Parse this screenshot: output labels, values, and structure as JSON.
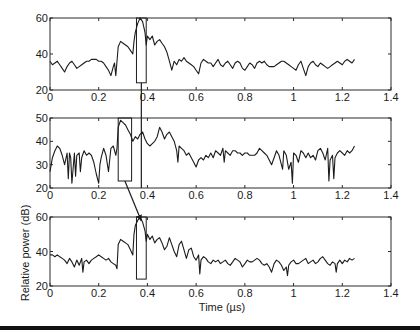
{
  "chart_data": {
    "type": "line",
    "figure": "Three stacked panels of relative power vs time with zoom boxes and arrows linking peak region",
    "xlabel": "Time (µs)",
    "ylabel": "Relative power (dB)",
    "xlim": [
      0,
      1.4
    ],
    "x_ticks": [
      0,
      0.2,
      0.4,
      0.6,
      0.8,
      1,
      1.2,
      1.4
    ],
    "x_tick_labels": [
      "0",
      "0.2",
      "0.4",
      "0.6",
      "0.8",
      "1",
      "1.2",
      "1.4"
    ],
    "grid": false,
    "legend": null,
    "panels": [
      {
        "name": "top",
        "ylim": [
          20,
          60
        ],
        "y_ticks": [
          20,
          40,
          60
        ],
        "y_tick_labels": [
          "20",
          "40",
          "60"
        ],
        "box": {
          "x0": 0.355,
          "x1": 0.395,
          "y0": 24,
          "y1": 60
        },
        "series": {
          "name": "panel-1",
          "x": [
            0,
            0.01,
            0.02,
            0.03,
            0.04,
            0.05,
            0.06,
            0.07,
            0.08,
            0.09,
            0.1,
            0.11,
            0.12,
            0.13,
            0.14,
            0.15,
            0.16,
            0.17,
            0.18,
            0.19,
            0.2,
            0.21,
            0.22,
            0.23,
            0.24,
            0.25,
            0.26,
            0.265,
            0.27,
            0.275,
            0.28,
            0.29,
            0.3,
            0.31,
            0.32,
            0.33,
            0.34,
            0.345,
            0.35,
            0.36,
            0.37,
            0.38,
            0.39,
            0.395,
            0.4,
            0.41,
            0.42,
            0.43,
            0.44,
            0.45,
            0.46,
            0.47,
            0.48,
            0.49,
            0.5,
            0.51,
            0.52,
            0.53,
            0.54,
            0.55,
            0.56,
            0.57,
            0.58,
            0.59,
            0.6,
            0.61,
            0.62,
            0.63,
            0.64,
            0.65,
            0.66,
            0.67,
            0.68,
            0.69,
            0.7,
            0.71,
            0.72,
            0.73,
            0.74,
            0.75,
            0.76,
            0.77,
            0.78,
            0.79,
            0.8,
            0.81,
            0.82,
            0.83,
            0.84,
            0.85,
            0.86,
            0.87,
            0.88,
            0.89,
            0.9,
            0.91,
            0.92,
            0.93,
            0.94,
            0.95,
            0.96,
            0.97,
            0.98,
            0.99,
            1.0,
            1.01,
            1.02,
            1.03,
            1.04,
            1.05,
            1.06,
            1.07,
            1.08,
            1.09,
            1.1,
            1.11,
            1.12,
            1.13,
            1.14,
            1.15,
            1.16,
            1.17,
            1.18,
            1.19,
            1.2,
            1.21,
            1.22,
            1.23,
            1.24,
            1.25
          ],
          "y": [
            36,
            34,
            35,
            36,
            34,
            32,
            30,
            33,
            35,
            36,
            34,
            32,
            33,
            34,
            35,
            36,
            36,
            37,
            37,
            37,
            36,
            36,
            35,
            33,
            31,
            28,
            33,
            35,
            28,
            36,
            44,
            47,
            46,
            45,
            44,
            42,
            40,
            47,
            52,
            57,
            60,
            58,
            52,
            45,
            50,
            48,
            50,
            45,
            47,
            48,
            46,
            44,
            41,
            36,
            31,
            36,
            34,
            37,
            36,
            38,
            36,
            35,
            34,
            33,
            31,
            29,
            35,
            37,
            36,
            35,
            35,
            33,
            35,
            37,
            34,
            33,
            35,
            36,
            34,
            32,
            35,
            36,
            35,
            32,
            31,
            33,
            35,
            34,
            32,
            35,
            36,
            35,
            36,
            34,
            33,
            33,
            33,
            34,
            35,
            36,
            36,
            35,
            34,
            33,
            32,
            31,
            34,
            36,
            32,
            28,
            33,
            35,
            36,
            34,
            33,
            35,
            34,
            33,
            32,
            33,
            34,
            35,
            36,
            35,
            34,
            36,
            37,
            36,
            35,
            37
          ]
        }
      },
      {
        "name": "middle",
        "ylim": [
          20,
          50
        ],
        "y_ticks": [
          20,
          30,
          40,
          50
        ],
        "y_tick_labels": [
          "20",
          "30",
          "40",
          "50"
        ],
        "box": {
          "x0": 0.28,
          "x1": 0.335,
          "y0": 23,
          "y1": 50
        },
        "series": {
          "name": "panel-2",
          "x": [
            0,
            0.01,
            0.02,
            0.03,
            0.04,
            0.05,
            0.06,
            0.07,
            0.075,
            0.08,
            0.085,
            0.09,
            0.1,
            0.105,
            0.11,
            0.12,
            0.125,
            0.13,
            0.14,
            0.15,
            0.16,
            0.17,
            0.18,
            0.19,
            0.2,
            0.205,
            0.21,
            0.22,
            0.23,
            0.24,
            0.25,
            0.26,
            0.27,
            0.275,
            0.28,
            0.29,
            0.3,
            0.31,
            0.32,
            0.33,
            0.34,
            0.35,
            0.36,
            0.37,
            0.38,
            0.39,
            0.4,
            0.41,
            0.42,
            0.43,
            0.44,
            0.45,
            0.46,
            0.47,
            0.48,
            0.49,
            0.5,
            0.51,
            0.52,
            0.525,
            0.53,
            0.54,
            0.55,
            0.56,
            0.57,
            0.58,
            0.59,
            0.6,
            0.61,
            0.62,
            0.63,
            0.64,
            0.65,
            0.66,
            0.67,
            0.68,
            0.69,
            0.7,
            0.71,
            0.715,
            0.72,
            0.73,
            0.74,
            0.75,
            0.76,
            0.77,
            0.78,
            0.79,
            0.8,
            0.81,
            0.82,
            0.83,
            0.84,
            0.85,
            0.86,
            0.87,
            0.88,
            0.89,
            0.9,
            0.91,
            0.92,
            0.93,
            0.94,
            0.95,
            0.955,
            0.96,
            0.97,
            0.98,
            0.99,
            0.995,
            1.0,
            1.01,
            1.02,
            1.03,
            1.04,
            1.05,
            1.06,
            1.07,
            1.08,
            1.09,
            1.1,
            1.11,
            1.12,
            1.13,
            1.14,
            1.145,
            1.15,
            1.16,
            1.165,
            1.17,
            1.18,
            1.19,
            1.2,
            1.21,
            1.22,
            1.23,
            1.24,
            1.25
          ],
          "y": [
            27,
            33,
            36,
            38,
            37,
            34,
            30,
            35,
            24,
            35,
            33,
            22,
            35,
            25,
            34,
            35,
            27,
            33,
            36,
            34,
            35,
            34,
            31,
            26,
            22,
            30,
            33,
            37,
            34,
            27,
            37,
            38,
            34,
            37,
            46,
            49,
            48,
            47,
            45,
            43,
            40,
            42,
            41,
            43,
            44,
            41,
            39,
            38,
            39,
            40,
            42,
            46,
            44,
            41,
            43,
            44,
            42,
            40,
            36,
            31,
            38,
            37,
            36,
            34,
            35,
            33,
            31,
            29,
            32,
            33,
            32,
            34,
            33,
            35,
            33,
            36,
            35,
            34,
            37,
            31,
            36,
            35,
            34,
            36,
            36,
            35,
            35,
            34,
            35,
            35,
            34,
            34,
            34,
            35,
            37,
            36,
            35,
            34,
            32,
            30,
            33,
            36,
            34,
            30,
            28,
            36,
            34,
            28,
            31,
            22,
            35,
            34,
            31,
            36,
            35,
            33,
            35,
            33,
            34,
            32,
            36,
            37,
            35,
            32,
            37,
            23,
            32,
            34,
            24,
            33,
            35,
            36,
            35,
            34,
            36,
            35,
            36,
            38
          ]
        }
      },
      {
        "name": "bottom",
        "ylim": [
          20,
          60
        ],
        "y_ticks": [
          20,
          40,
          60
        ],
        "y_tick_labels": [
          "20",
          "40",
          "60"
        ],
        "box": {
          "x0": 0.355,
          "x1": 0.395,
          "y0": 24,
          "y1": 60
        },
        "series": {
          "name": "panel-3",
          "x": [
            0,
            0.01,
            0.02,
            0.03,
            0.04,
            0.05,
            0.06,
            0.07,
            0.08,
            0.09,
            0.1,
            0.11,
            0.12,
            0.13,
            0.135,
            0.14,
            0.15,
            0.16,
            0.17,
            0.18,
            0.19,
            0.2,
            0.21,
            0.22,
            0.23,
            0.24,
            0.25,
            0.26,
            0.27,
            0.275,
            0.28,
            0.29,
            0.3,
            0.31,
            0.32,
            0.33,
            0.34,
            0.345,
            0.35,
            0.36,
            0.37,
            0.38,
            0.39,
            0.395,
            0.4,
            0.41,
            0.42,
            0.43,
            0.44,
            0.45,
            0.46,
            0.47,
            0.48,
            0.49,
            0.5,
            0.51,
            0.52,
            0.53,
            0.54,
            0.55,
            0.56,
            0.57,
            0.58,
            0.59,
            0.6,
            0.61,
            0.615,
            0.62,
            0.63,
            0.64,
            0.65,
            0.66,
            0.67,
            0.68,
            0.69,
            0.7,
            0.71,
            0.72,
            0.73,
            0.74,
            0.75,
            0.76,
            0.77,
            0.78,
            0.79,
            0.8,
            0.81,
            0.82,
            0.83,
            0.84,
            0.85,
            0.86,
            0.87,
            0.88,
            0.89,
            0.9,
            0.91,
            0.92,
            0.93,
            0.94,
            0.95,
            0.96,
            0.97,
            0.975,
            0.98,
            0.99,
            1.0,
            1.01,
            1.02,
            1.03,
            1.04,
            1.05,
            1.06,
            1.07,
            1.08,
            1.09,
            1.1,
            1.11,
            1.12,
            1.13,
            1.14,
            1.15,
            1.16,
            1.17,
            1.175,
            1.18,
            1.19,
            1.2,
            1.21,
            1.22,
            1.23,
            1.24,
            1.25
          ],
          "y": [
            38,
            38,
            37,
            38,
            37,
            36,
            35,
            33,
            36,
            34,
            31,
            35,
            32,
            36,
            28,
            34,
            35,
            33,
            35,
            36,
            37,
            38,
            37,
            36,
            35,
            36,
            34,
            33,
            32,
            30,
            44,
            47,
            46,
            45,
            44,
            41,
            38,
            50,
            55,
            58,
            60,
            57,
            52,
            46,
            50,
            47,
            49,
            45,
            47,
            48,
            45,
            41,
            43,
            48,
            44,
            40,
            37,
            44,
            46,
            41,
            36,
            41,
            42,
            37,
            35,
            38,
            27,
            35,
            37,
            36,
            34,
            33,
            35,
            34,
            35,
            33,
            34,
            35,
            33,
            32,
            34,
            36,
            35,
            34,
            31,
            33,
            35,
            34,
            34,
            35,
            36,
            35,
            33,
            32,
            33,
            31,
            28,
            33,
            35,
            34,
            32,
            29,
            31,
            26,
            32,
            34,
            35,
            33,
            33,
            34,
            35,
            36,
            33,
            34,
            35,
            33,
            34,
            36,
            37,
            35,
            33,
            32,
            34,
            33,
            28,
            33,
            35,
            33,
            35,
            34,
            36,
            35,
            36
          ]
        }
      }
    ],
    "annotations": [
      {
        "type": "arrow",
        "from_panel": "top",
        "to_panel": "middle",
        "description": "vertical line from top box down through middle panel at t≈0.37"
      },
      {
        "type": "arrow",
        "from_panel": "middle",
        "to_panel": "bottom",
        "description": "arrow from bottom of middle box to peak of bottom panel"
      }
    ]
  },
  "labels": {
    "xlabel": "Time (µs)",
    "ylabel": "Relative power (dB)"
  }
}
